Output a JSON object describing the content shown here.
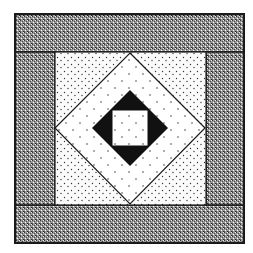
{
  "figure": {
    "title": "",
    "colors": {
      "background": "#ffffff",
      "outline": "#1a1a1a",
      "dense_stipple": "#8a8a8a",
      "light_stipple": "#f2f2f2",
      "diamond_fill": "#ffffff",
      "inner_square_frame": "#111111",
      "center_square": "#f6f6f6"
    }
  }
}
